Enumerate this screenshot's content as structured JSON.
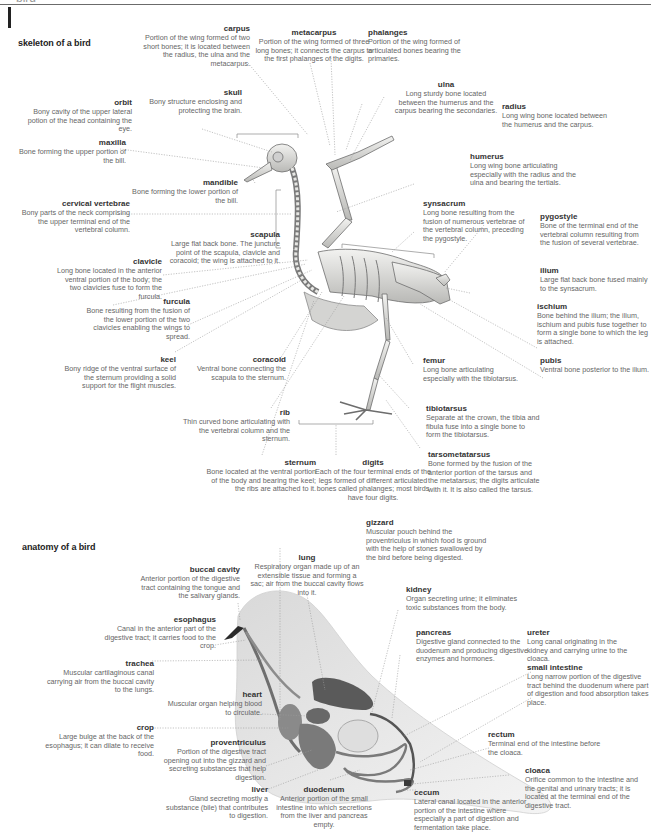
{
  "header": {
    "title": "bird"
  },
  "skeleton": {
    "section_title": "skeleton of a bird",
    "labels": [
      {
        "term": "carpus",
        "desc": "Portion of the wing formed of two short bones; it is located between the radius, the ulna and the metacarpus."
      },
      {
        "term": "metacarpus",
        "desc": "Portion of the wing formed of three long bones; it connects the carpus to the first phalanges of the digits."
      },
      {
        "term": "phalanges",
        "desc": "Portion of the wing formed of articulated bones bearing the primaries."
      },
      {
        "term": "skull",
        "desc": "Bony structure enclosing and protecting the brain."
      },
      {
        "term": "orbit",
        "desc": "Bony cavity of the upper lateral potion of the head containing the eye."
      },
      {
        "term": "ulna",
        "desc": "Long sturdy bone located between the humerus and the carpus bearing the secondaries."
      },
      {
        "term": "radius",
        "desc": "Long wing bone located between the humerus and the carpus."
      },
      {
        "term": "maxilla",
        "desc": "Bone forming the upper portion of the bill."
      },
      {
        "term": "mandible",
        "desc": "Bone forming the lower portion of the bill."
      },
      {
        "term": "humerus",
        "desc": "Long wing bone articulating especially with the radius and the ulna and bearing the tertials."
      },
      {
        "term": "cervical vertebrae",
        "desc": "Bony parts of the neck comprising the upper terminal end of the vertebral column."
      },
      {
        "term": "synsacrum",
        "desc": "Long bone resulting from the fusion of numerous vertebrae of the vertebral column, preceding the pygostyle."
      },
      {
        "term": "pygostyle",
        "desc": "Bone of the terminal end of the vertebral column resulting from the fusion of several vertebrae."
      },
      {
        "term": "scapula",
        "desc": "Large flat back bone. The juncture point of the scapula, clavicle and coracoid; the wing is attached to it."
      },
      {
        "term": "clavicle",
        "desc": "Long bone located in the anterior ventral portion of the body; the two clavicles fuse to form the furcula."
      },
      {
        "term": "ilium",
        "desc": "Large flat back bone fused mainly to the synsacrum."
      },
      {
        "term": "furcula",
        "desc": "Bone resulting from the fusion of the lower portion of the two clavicles enabling the wings to spread."
      },
      {
        "term": "ischium",
        "desc": "Bone behind the ilium; the ilium, ischium and pubis fuse together to form a single bone to which the leg is attached."
      },
      {
        "term": "keel",
        "desc": "Bony ridge of the ventral surface of the sternum providing a solid support for the flight muscles."
      },
      {
        "term": "coracoid",
        "desc": "Ventral bone connecting the scapula to the sternum."
      },
      {
        "term": "femur",
        "desc": "Long bone articulating especially with the tibiotarsus."
      },
      {
        "term": "pubis",
        "desc": "Ventral bone posterior to the ilium."
      },
      {
        "term": "rib",
        "desc": "Thin curved bone articulating with the vertebral column and the sternum."
      },
      {
        "term": "tibiotarsus",
        "desc": "Separate at the crown, the tibia and fibula fuse into a single bone to form the tibiotarsus."
      },
      {
        "term": "sternum",
        "desc": "Bone located at the ventral portion of the body and bearing the keel; the ribs are attached to it."
      },
      {
        "term": "digits",
        "desc": "Each of the four terminal ends of the legs formed of different articulated bones called phalanges; most birds have four digits."
      },
      {
        "term": "tarsometatarsus",
        "desc": "Bone formed by the fusion of the anterior portion of the tarsus and the metatarsus; the digits articulate with it. It is also called the tarsus."
      }
    ]
  },
  "anatomy": {
    "section_title": "anatomy of a bird",
    "labels": [
      {
        "term": "gizzard",
        "desc": "Muscular pouch behind the proventriculus in which food is ground with the help of stones swallowed by the bird before being digested."
      },
      {
        "term": "lung",
        "desc": "Respiratory organ made up of an extensible tissue and forming a sac; air from the buccal cavity flows into it."
      },
      {
        "term": "buccal cavity",
        "desc": "Anterior portion of the digestive tract containing the tongue and the salivary glands."
      },
      {
        "term": "kidney",
        "desc": "Organ secreting urine; it eliminates toxic substances from the body."
      },
      {
        "term": "esophagus",
        "desc": "Canal in the anterior part of the digestive tract; it carries food to the crop."
      },
      {
        "term": "pancreas",
        "desc": "Digestive gland connected to the duodenum and producing digestive enzymes and hormones."
      },
      {
        "term": "ureter",
        "desc": "Long canal originating in the kidney and carrying urine to the cloaca."
      },
      {
        "term": "trachea",
        "desc": "Muscular cartilaginous canal carrying air from the buccal cavity to the lungs."
      },
      {
        "term": "small intestine",
        "desc": "Long narrow portion of the digestive tract behind the duodenum where part of digestion and food absorption takes place."
      },
      {
        "term": "heart",
        "desc": "Muscular organ helping blood to circulate."
      },
      {
        "term": "crop",
        "desc": "Large bulge at the back of the esophagus; it can dilate to receive food."
      },
      {
        "term": "proventriculus",
        "desc": "Portion of the digestive tract opening out into the gizzard and secreting substances that help digestion."
      },
      {
        "term": "rectum",
        "desc": "Terminal end of the intestine before the cloaca."
      },
      {
        "term": "cloaca",
        "desc": "Orifice common to the intestine and the genital and urinary tracts; it is located at the terminal end of the digestive tract."
      },
      {
        "term": "liver",
        "desc": "Gland secreting mostly a substance (bile) that contributes to digestion."
      },
      {
        "term": "duodenum",
        "desc": "Anterior portion of the small intestine into which secretions from the liver and pancreas empty."
      },
      {
        "term": "cecum",
        "desc": "Lateral canal located in the anterior portion of the intestine where especially a part of digestion and fermentation take place."
      }
    ]
  }
}
